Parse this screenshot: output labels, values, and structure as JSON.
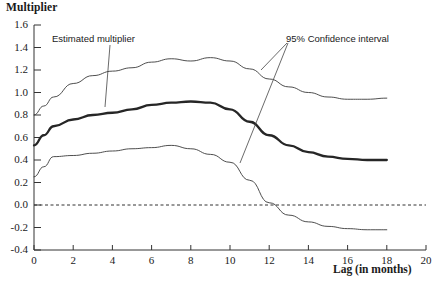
{
  "chart_data": {
    "type": "line",
    "title": "",
    "ylabel": "Multiplier",
    "xlabel": "Lag (in months)",
    "xlim": [
      0,
      20
    ],
    "ylim": [
      -0.4,
      1.6
    ],
    "grid": false,
    "legend_position": "inline-annotations",
    "xticks": [
      "0",
      "2",
      "4",
      "6",
      "8",
      "10",
      "12",
      "14",
      "16",
      "18",
      "20"
    ],
    "xtick_values": [
      0,
      2,
      4,
      6,
      8,
      10,
      12,
      14,
      16,
      18,
      20
    ],
    "yticks": [
      "1.6",
      "1.4",
      "1.2",
      "1.0",
      "0.8",
      "0.6",
      "0.4",
      "0.2",
      "0.0",
      "-0.2",
      "-0.4"
    ],
    "ytick_values": [
      1.6,
      1.4,
      1.2,
      1.0,
      0.8,
      0.6,
      0.4,
      0.2,
      0.0,
      -0.2,
      -0.4
    ],
    "zero_reference_line": 0.0,
    "x": [
      0,
      0.5,
      1,
      2,
      3,
      4,
      5,
      6,
      7,
      8,
      9,
      10,
      11,
      12,
      13,
      14,
      15,
      16,
      17,
      18
    ],
    "series": [
      {
        "name": "Upper 95% confidence bound",
        "style": "thin-solid",
        "color": "#3a3a3a",
        "values": [
          0.8,
          0.88,
          0.96,
          1.08,
          1.15,
          1.19,
          1.22,
          1.27,
          1.3,
          1.28,
          1.31,
          1.28,
          1.21,
          1.12,
          1.05,
          1.0,
          0.96,
          0.94,
          0.94,
          0.95
        ]
      },
      {
        "name": "Estimated multiplier",
        "style": "thick-solid",
        "color": "#262626",
        "values": [
          0.53,
          0.62,
          0.7,
          0.76,
          0.8,
          0.82,
          0.85,
          0.89,
          0.91,
          0.92,
          0.91,
          0.85,
          0.74,
          0.62,
          0.53,
          0.47,
          0.43,
          0.41,
          0.4,
          0.4
        ]
      },
      {
        "name": "Lower 95% confidence bound",
        "style": "thin-solid",
        "color": "#3a3a3a",
        "values": [
          0.25,
          0.34,
          0.43,
          0.44,
          0.46,
          0.48,
          0.5,
          0.51,
          0.53,
          0.5,
          0.45,
          0.38,
          0.22,
          0.02,
          -0.09,
          -0.15,
          -0.19,
          -0.21,
          -0.22,
          -0.22
        ]
      }
    ],
    "annotations": [
      {
        "name": "estimated-multiplier-annotation",
        "text": "Estimated multiplier",
        "leader_from": [
          52,
          44
        ],
        "leader_to": [
          108,
          104
        ]
      },
      {
        "name": "confidence-interval-annotation",
        "text": "95% Confidence interval",
        "leader_from": [
          286,
          44
        ],
        "leader_to": [
          238,
          160
        ]
      }
    ]
  }
}
